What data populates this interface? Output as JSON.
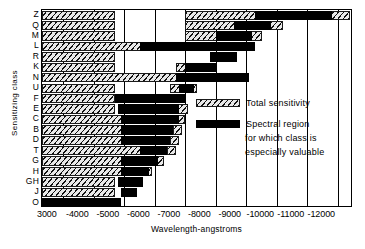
{
  "axes": {
    "ylabel": "Sensitizing class",
    "xlabel": "Wavelength-angstroms",
    "xticks": [
      "3000",
      "4000",
      "5000",
      "6000",
      "7000",
      "8000",
      "9000",
      "10000",
      "11000",
      "12000"
    ]
  },
  "legend": {
    "total_label": "Total sensitivity",
    "spectral_label_1": "Spectral region",
    "spectral_label_2": "for which class is",
    "spectral_label_3": "especially  valuable"
  },
  "colors": {
    "solid": "#000000",
    "hatch_ink": "#111111",
    "hatch_bg": "#e8e8e8",
    "axis": "#000000"
  },
  "chart_data": {
    "type": "bar",
    "orientation": "horizontal",
    "title": "",
    "xlabel": "Wavelength-angstroms",
    "ylabel": "Sensitizing class",
    "xlim": [
      2300,
      12500
    ],
    "xticks": [
      3000,
      4000,
      5000,
      6000,
      7000,
      8000,
      9000,
      10000,
      11000,
      12000
    ],
    "grid": "vertical",
    "legend_position": "inside-right",
    "units": "angstroms",
    "series": [
      {
        "name": "Total sensitivity",
        "style": "hatched"
      },
      {
        "name": "Spectral region for which class is especially valuable",
        "style": "solid"
      }
    ],
    "categories": [
      "Z",
      "Q",
      "M",
      "L",
      "R",
      "K",
      "N",
      "U",
      "F",
      "E",
      "C",
      "B",
      "D",
      "T",
      "G",
      "H",
      "GH",
      "J",
      "O"
    ],
    "rows": [
      {
        "category": "Z",
        "total": [
          [
            2300,
            4700
          ],
          [
            7000,
            12400
          ]
        ],
        "valuable": [
          [
            9300,
            11800
          ]
        ]
      },
      {
        "category": "Q",
        "total": [
          [
            2300,
            4700
          ],
          [
            7000,
            10200
          ]
        ],
        "valuable": [
          [
            8600,
            9800
          ]
        ]
      },
      {
        "category": "M",
        "total": [
          [
            2300,
            4700
          ],
          [
            7000,
            9500
          ]
        ],
        "valuable": [
          [
            8000,
            9200
          ]
        ]
      },
      {
        "category": "L",
        "total": [
          [
            2300,
            5800
          ]
        ],
        "valuable": [
          [
            5500,
            9300
          ]
        ]
      },
      {
        "category": "R",
        "total": [
          [
            2300,
            4700
          ]
        ],
        "valuable": [
          [
            7800,
            8700
          ]
        ]
      },
      {
        "category": "K",
        "total": [
          [
            2300,
            4700
          ],
          [
            6700,
            7500
          ]
        ],
        "valuable": [
          [
            7000,
            8000
          ]
        ]
      },
      {
        "category": "N",
        "total": [
          [
            2300,
            6900
          ]
        ],
        "valuable": [
          [
            6700,
            9100
          ]
        ]
      },
      {
        "category": "U",
        "total": [
          [
            2300,
            4700
          ],
          [
            6500,
            7400
          ]
        ],
        "valuable": [
          [
            6800,
            7300
          ]
        ]
      },
      {
        "category": "F",
        "total": [
          [
            2300,
            4700
          ]
        ],
        "valuable": [
          [
            4700,
            7000
          ]
        ]
      },
      {
        "category": "E",
        "total": [
          [
            2300,
            4700
          ],
          [
            6600,
            7100
          ]
        ],
        "valuable": [
          [
            4800,
            6800
          ]
        ]
      },
      {
        "category": "C",
        "total": [
          [
            2300,
            5000
          ],
          [
            6700,
            7000
          ]
        ],
        "valuable": [
          [
            4900,
            6800
          ]
        ]
      },
      {
        "category": "B",
        "total": [
          [
            2300,
            5000
          ],
          [
            6600,
            6900
          ]
        ],
        "valuable": [
          [
            4900,
            6600
          ]
        ]
      },
      {
        "category": "D",
        "total": [
          [
            2300,
            5000
          ],
          [
            6500,
            6800
          ]
        ],
        "valuable": [
          [
            4900,
            6500
          ]
        ]
      },
      {
        "category": "T",
        "total": [
          [
            2300,
            5600
          ],
          [
            6400,
            6700
          ]
        ],
        "valuable": [
          [
            5500,
            6400
          ]
        ]
      },
      {
        "category": "G",
        "total": [
          [
            2300,
            5000
          ],
          [
            6000,
            6300
          ]
        ],
        "valuable": [
          [
            4900,
            6100
          ]
        ]
      },
      {
        "category": "H",
        "total": [
          [
            2300,
            5000
          ],
          [
            5700,
            5900
          ]
        ],
        "valuable": [
          [
            4900,
            5800
          ]
        ]
      },
      {
        "category": "GH",
        "total": [
          [
            2300,
            4700
          ]
        ],
        "valuable": [
          [
            4800,
            5600
          ]
        ]
      },
      {
        "category": "J",
        "total": [
          [
            2300,
            4700
          ]
        ],
        "valuable": [
          [
            4900,
            5400
          ]
        ]
      },
      {
        "category": "O",
        "total": [],
        "valuable": [
          [
            2300,
            4900
          ]
        ]
      }
    ]
  }
}
